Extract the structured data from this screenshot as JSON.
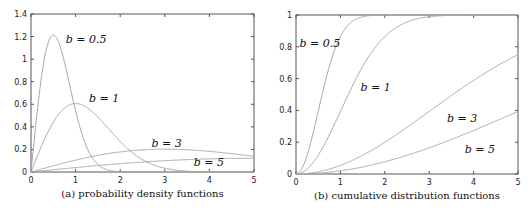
{
  "chart_data": [
    {
      "type": "line",
      "title": "(a) probability density functions",
      "xlabel": "",
      "ylabel": "",
      "xlim": [
        0,
        5
      ],
      "ylim": [
        0,
        1.4
      ],
      "xticks": [
        "0",
        "1",
        "2",
        "3",
        "4",
        "5"
      ],
      "yticks": [
        "0",
        "0.2",
        "0.4",
        "0.6",
        "0.8",
        "1",
        "1.2",
        "1.4"
      ],
      "grid": false,
      "function": "rayleigh_pdf",
      "series": [
        {
          "name": "b = 0.5",
          "b": 0.5,
          "label_x": 0.78,
          "label_y": 1.14
        },
        {
          "name": "b = 1",
          "b": 1,
          "label_x": 1.3,
          "label_y": 0.62
        },
        {
          "name": "b = 3",
          "b": 3,
          "label_x": 2.7,
          "label_y": 0.22
        },
        {
          "name": "b = 5",
          "b": 5,
          "label_x": 3.65,
          "label_y": 0.05
        }
      ],
      "peaks": {
        "b = 0.5": 1.21,
        "b = 1": 0.61,
        "b = 3": 0.2,
        "b = 5": 0.12
      }
    },
    {
      "type": "line",
      "title": "(b) cumulative distribution functions",
      "xlabel": "",
      "ylabel": "",
      "xlim": [
        0,
        5
      ],
      "ylim": [
        0,
        1
      ],
      "xticks": [
        "0",
        "1",
        "2",
        "3",
        "4",
        "5"
      ],
      "yticks": [
        "0",
        "0.2",
        "0.4",
        "0.6",
        "0.8",
        "1"
      ],
      "grid": false,
      "function": "rayleigh_cdf",
      "series": [
        {
          "name": "b = 0.5",
          "b": 0.5,
          "label_x": 0.08,
          "label_y": 0.8
        },
        {
          "name": "b = 1",
          "b": 1,
          "label_x": 1.45,
          "label_y": 0.52
        },
        {
          "name": "b = 3",
          "b": 3,
          "label_x": 3.4,
          "label_y": 0.33
        },
        {
          "name": "b = 5",
          "b": 5,
          "label_x": 3.8,
          "label_y": 0.13
        }
      ],
      "values_at_x5": {
        "b = 0.5": 1.0,
        "b = 1": 1.0,
        "b = 3": 0.75,
        "b = 5": 0.39
      }
    }
  ],
  "style": {
    "curve_color": "#a8a8a8",
    "axis_color": "#555555"
  }
}
